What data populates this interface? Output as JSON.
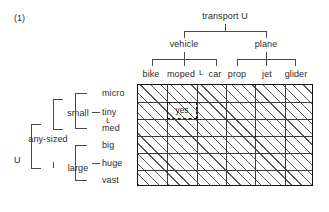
{
  "figure": {
    "number": "(1)",
    "root_label": "transport U",
    "left_root_label": "U"
  },
  "column_tree": {
    "root": "transport U",
    "level2": [
      {
        "label": "vehicle"
      },
      {
        "label": "plane"
      }
    ],
    "leaves": [
      "bike",
      "moped",
      "L",
      "car",
      "prop",
      "jet",
      "glider"
    ],
    "columns": [
      "bike",
      "moped",
      "car",
      "prop",
      "jet",
      "glider"
    ]
  },
  "row_tree": {
    "root": "U",
    "level2": "any-sized",
    "level3": [
      {
        "label": "small"
      },
      {
        "label": "large"
      }
    ],
    "leaves": [
      "micro",
      "tiny",
      "L",
      "med",
      "big",
      "huge",
      "vast"
    ],
    "rows": [
      "micro",
      "tiny",
      "med",
      "big",
      "huge",
      "vast"
    ]
  },
  "grid": {
    "columns": 6,
    "rows": 6,
    "fill_style": "diagonal-hatch",
    "marked_cell": {
      "label": "yes",
      "column_index": 1,
      "row_index": 1,
      "column_label": "moped",
      "row_label": "tiny",
      "border_style": "dashed"
    }
  },
  "colors": {
    "text": "#2b2b2b",
    "grid_border": "#111111",
    "grid_line": "#3c3c3c",
    "hatch": "#3c3c3c",
    "connector": "#4a4a4a",
    "background": "#ffffff"
  }
}
